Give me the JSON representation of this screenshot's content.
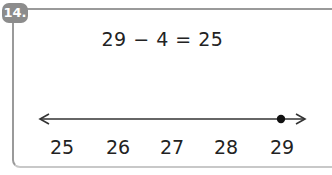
{
  "problem": {
    "number": "14.",
    "equation": "29 − 4 = 25"
  },
  "number_line": {
    "labels": [
      "25",
      "26",
      "27",
      "28",
      "29"
    ],
    "marked_point": "29",
    "label_x": [
      57,
      118,
      178,
      239,
      299
    ],
    "line_color": "#333333",
    "point_color": "#111111"
  }
}
